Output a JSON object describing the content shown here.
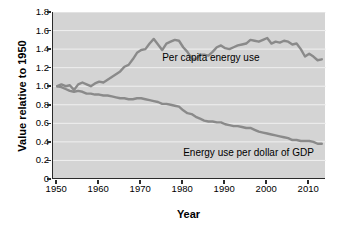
{
  "chart_data": {
    "type": "line",
    "title": "",
    "xlabel": "Year",
    "ylabel": "Value relative to 1950",
    "xlim": [
      1949,
      2014
    ],
    "ylim": [
      0,
      1.8
    ],
    "grid": true,
    "grid_axis": "y",
    "legend_position": "inline-annotations",
    "plot_background": "#d4d4d4",
    "line_color": "#8a8a8a",
    "axis_color": "#2b2b2b",
    "xticks": [
      1950,
      1960,
      1970,
      1980,
      1990,
      2000,
      2010
    ],
    "xtick_labels": [
      "1950",
      "1960",
      "1970",
      "1980",
      "1990",
      "2000",
      "2010"
    ],
    "yticks": [
      0,
      0.2,
      0.4,
      0.6,
      0.8,
      1.0,
      1.2,
      1.4,
      1.6,
      1.8
    ],
    "ytick_labels": [
      "0",
      "0.2",
      "0.4",
      "0.6",
      "0.8",
      "1.0",
      "1.2",
      "1.4",
      "1.6",
      "1.8"
    ],
    "series": [
      {
        "name": "Per capita energy use",
        "annotation": "Per capita energy use",
        "color": "#8a8a8a",
        "x": [
          1950,
          1951,
          1952,
          1953,
          1954,
          1955,
          1956,
          1957,
          1958,
          1959,
          1960,
          1961,
          1962,
          1963,
          1964,
          1965,
          1966,
          1967,
          1968,
          1969,
          1970,
          1971,
          1972,
          1973,
          1974,
          1975,
          1976,
          1977,
          1978,
          1979,
          1980,
          1981,
          1982,
          1983,
          1984,
          1985,
          1986,
          1987,
          1988,
          1989,
          1990,
          1991,
          1992,
          1993,
          1994,
          1995,
          1996,
          1997,
          1998,
          1999,
          2000,
          2001,
          2002,
          2003,
          2004,
          2005,
          2006,
          2007,
          2008,
          2009,
          2010,
          2011,
          2012,
          2013
        ],
        "y": [
          1.0,
          1.02,
          1.0,
          1.01,
          0.96,
          1.02,
          1.04,
          1.02,
          1.0,
          1.03,
          1.05,
          1.04,
          1.07,
          1.1,
          1.13,
          1.16,
          1.21,
          1.23,
          1.29,
          1.36,
          1.39,
          1.4,
          1.46,
          1.51,
          1.45,
          1.39,
          1.46,
          1.48,
          1.5,
          1.49,
          1.42,
          1.37,
          1.3,
          1.29,
          1.34,
          1.34,
          1.33,
          1.37,
          1.42,
          1.44,
          1.41,
          1.4,
          1.42,
          1.44,
          1.45,
          1.46,
          1.5,
          1.49,
          1.48,
          1.5,
          1.52,
          1.46,
          1.48,
          1.47,
          1.49,
          1.48,
          1.45,
          1.46,
          1.4,
          1.32,
          1.35,
          1.32,
          1.28,
          1.29
        ]
      },
      {
        "name": "Energy use per dollar of GDP",
        "annotation": "Energy use per dollar of GDP",
        "color": "#8a8a8a",
        "x": [
          1950,
          1951,
          1952,
          1953,
          1954,
          1955,
          1956,
          1957,
          1958,
          1959,
          1960,
          1961,
          1962,
          1963,
          1964,
          1965,
          1966,
          1967,
          1968,
          1969,
          1970,
          1971,
          1972,
          1973,
          1974,
          1975,
          1976,
          1977,
          1978,
          1979,
          1980,
          1981,
          1982,
          1983,
          1984,
          1985,
          1986,
          1987,
          1988,
          1989,
          1990,
          1991,
          1992,
          1993,
          1994,
          1995,
          1996,
          1997,
          1998,
          1999,
          2000,
          2001,
          2002,
          2003,
          2004,
          2005,
          2006,
          2007,
          2008,
          2009,
          2010,
          2011,
          2012,
          2013
        ],
        "y": [
          1.0,
          0.99,
          0.97,
          0.95,
          0.94,
          0.95,
          0.94,
          0.92,
          0.92,
          0.91,
          0.91,
          0.9,
          0.9,
          0.89,
          0.88,
          0.87,
          0.87,
          0.86,
          0.86,
          0.87,
          0.87,
          0.86,
          0.85,
          0.84,
          0.83,
          0.81,
          0.81,
          0.8,
          0.79,
          0.78,
          0.74,
          0.71,
          0.7,
          0.67,
          0.65,
          0.63,
          0.62,
          0.62,
          0.61,
          0.61,
          0.59,
          0.58,
          0.57,
          0.57,
          0.56,
          0.55,
          0.55,
          0.53,
          0.51,
          0.5,
          0.49,
          0.48,
          0.47,
          0.46,
          0.45,
          0.44,
          0.42,
          0.42,
          0.41,
          0.41,
          0.41,
          0.4,
          0.38,
          0.38
        ]
      }
    ]
  }
}
